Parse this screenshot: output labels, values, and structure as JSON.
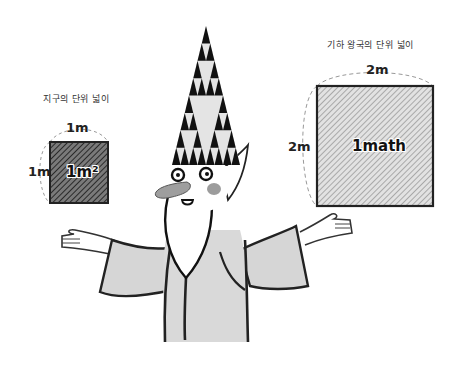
{
  "illustration": {
    "left_panel": {
      "caption": "지구의 단위 넓이",
      "top_dimension": "1m",
      "side_dimension": "1m",
      "square_label": "1m²",
      "square_fill": "#555555"
    },
    "right_panel": {
      "caption": "기하 왕국의 단위 넓이",
      "top_dimension": "2m",
      "side_dimension": "2m",
      "square_label": "1math",
      "square_fill": "#bbbbbb"
    },
    "character": {
      "description": "wizard with Sierpinski-triangle hat, arms spread",
      "robe_color": "#d6d6d6",
      "hat_color": "#111111"
    }
  }
}
